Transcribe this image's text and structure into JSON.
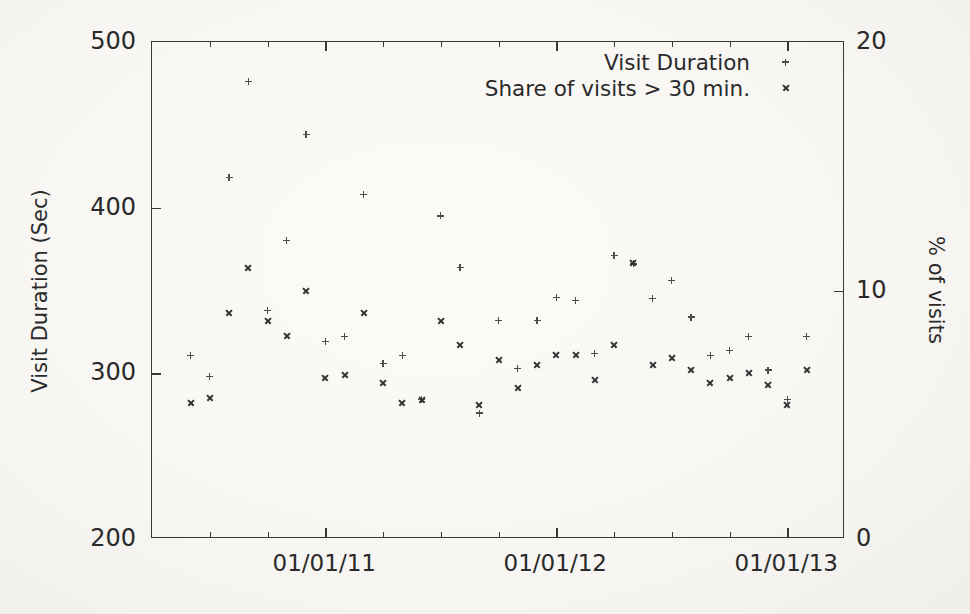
{
  "figure": {
    "background": "#f7f6f2",
    "axis_color": "#383838",
    "text_color": "#2a2a2a"
  },
  "chart_data": {
    "type": "scatter",
    "title": "",
    "xlabel": "",
    "grid": false,
    "legend_position": "top-right-inside",
    "x_axis": {
      "start_month": "2010-04",
      "end_month": "2013-04",
      "minor_tick_every_months": 3,
      "major_tick_months": [
        "2011-01",
        "2012-01",
        "2013-01"
      ],
      "major_tick_labels": [
        "01/01/11",
        "01/01/12",
        "01/01/13"
      ]
    },
    "left_axis": {
      "label": "Visit Duration (Sec)",
      "min": 200,
      "max": 500,
      "major_ticks": [
        200,
        300,
        400,
        500
      ]
    },
    "right_axis": {
      "label": "% of visits",
      "min": 0,
      "max": 20,
      "major_ticks": [
        0,
        10,
        20
      ]
    },
    "months": [
      "2010-06",
      "2010-07",
      "2010-08",
      "2010-09",
      "2010-10",
      "2010-11",
      "2010-12",
      "2011-01",
      "2011-02",
      "2011-03",
      "2011-04",
      "2011-05",
      "2011-06",
      "2011-07",
      "2011-08",
      "2011-09",
      "2011-10",
      "2011-11",
      "2011-12",
      "2012-01",
      "2012-02",
      "2012-03",
      "2012-04",
      "2012-05",
      "2012-06",
      "2012-07",
      "2012-08",
      "2012-09",
      "2012-10",
      "2012-11",
      "2012-12",
      "2013-01",
      "2013-02"
    ],
    "series": [
      {
        "name": "Visit Duration",
        "axis": "left",
        "marker": "plus",
        "marker_color": "#4c4c4c",
        "values": [
          311,
          298,
          418,
          476,
          338,
          380,
          444,
          319,
          322,
          408,
          306,
          311,
          284,
          395,
          364,
          276,
          332,
          303,
          332,
          346,
          344,
          312,
          371,
          366,
          345,
          356,
          334,
          311,
          314,
          322,
          302,
          284,
          322
        ]
      },
      {
        "name": "Share of visits > 30 min.",
        "axis": "right",
        "marker": "cross",
        "marker_color": "#333333",
        "values": [
          5.5,
          5.7,
          9.1,
          10.9,
          8.8,
          8.2,
          10.0,
          6.5,
          6.6,
          9.1,
          6.3,
          5.5,
          5.6,
          8.8,
          7.8,
          5.4,
          7.2,
          6.1,
          7.0,
          7.4,
          7.4,
          6.4,
          7.8,
          11.1,
          7.0,
          7.3,
          6.8,
          6.3,
          6.5,
          6.7,
          6.2,
          5.4,
          6.8
        ]
      }
    ],
    "legend": {
      "items": [
        "Visit Duration",
        "Share of visits > 30 min."
      ]
    }
  }
}
